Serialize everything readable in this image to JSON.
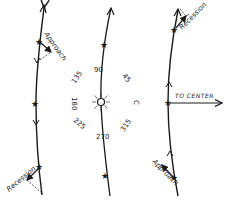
{
  "diagram": {
    "left_panel": {
      "approach_label": "Approach",
      "recession_label": "Recession"
    },
    "center_panel": {
      "angles": {
        "a90": "90",
        "a45": "45",
        "a135": "135",
        "a180": "180",
        "a225": "225",
        "a270": "270",
        "a315": "315"
      },
      "c_label": "C",
      "sun_symbol": "sun-icon"
    },
    "right_panel": {
      "recession_label": "Recession",
      "to_center_label": "TO CENTER",
      "approach_label": "Approach"
    },
    "colors": {
      "ink": "#1a1a1a",
      "background": "#ffffff"
    }
  }
}
